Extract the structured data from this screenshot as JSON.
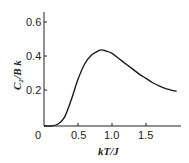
{
  "chart_data": {
    "type": "line",
    "title": "",
    "xlabel": "kT/J",
    "ylabel": "C₂/B k",
    "xlim": [
      0,
      2.0
    ],
    "ylim": [
      0,
      0.65
    ],
    "xticks": [
      "0",
      "0.5",
      "1.0",
      "1.5"
    ],
    "yticks": [
      "0.2",
      "0.4",
      "0.6"
    ],
    "grid": false,
    "legend": null,
    "series": [
      {
        "name": "C2/Bk",
        "x": [
          0.0,
          0.1,
          0.2,
          0.3,
          0.4,
          0.5,
          0.6,
          0.7,
          0.8,
          0.85,
          0.9,
          1.0,
          1.1,
          1.2,
          1.3,
          1.4,
          1.5,
          1.6,
          1.7,
          1.8,
          1.95
        ],
        "y": [
          0.0,
          0.0,
          0.01,
          0.05,
          0.15,
          0.27,
          0.36,
          0.41,
          0.435,
          0.44,
          0.435,
          0.42,
          0.39,
          0.36,
          0.33,
          0.3,
          0.275,
          0.25,
          0.23,
          0.215,
          0.2
        ]
      }
    ]
  }
}
